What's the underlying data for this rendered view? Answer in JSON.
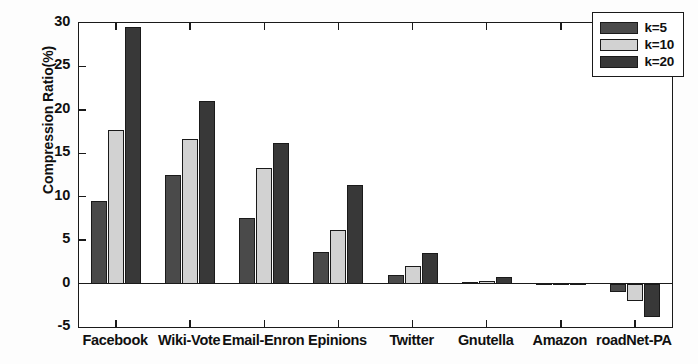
{
  "chart_data": {
    "type": "bar",
    "title": "",
    "xlabel": "",
    "ylabel": "Compression Ratio(%)",
    "ylim": [
      -5,
      30
    ],
    "yticks": [
      -5,
      0,
      5,
      10,
      15,
      20,
      25,
      30
    ],
    "ytick_labels": [
      "-5",
      "0",
      "5",
      "10",
      "15",
      "20",
      "25",
      "30"
    ],
    "grid": false,
    "legend_position": "top-right",
    "categories": [
      "Facebook",
      "Wiki-Vote",
      "Email-Enron",
      "Epinions",
      "Twitter",
      "Gnutella",
      "Amazon",
      "roadNet-PA"
    ],
    "series": [
      {
        "name": "k=5",
        "color": "#4a4a4a",
        "values": [
          9.5,
          12.5,
          7.5,
          3.6,
          1.0,
          0.2,
          0.05,
          -1.0
        ]
      },
      {
        "name": "k=10",
        "color": "#d2d2d2",
        "values": [
          17.7,
          16.7,
          13.3,
          6.2,
          2.0,
          0.35,
          0.1,
          -2.0
        ]
      },
      {
        "name": "k=20",
        "color": "#383838",
        "values": [
          29.5,
          21.0,
          16.2,
          11.3,
          3.5,
          0.7,
          0.12,
          -3.8
        ]
      }
    ]
  },
  "legend": {
    "items": [
      {
        "label": "k=5"
      },
      {
        "label": "k=10"
      },
      {
        "label": "k=20"
      }
    ]
  }
}
